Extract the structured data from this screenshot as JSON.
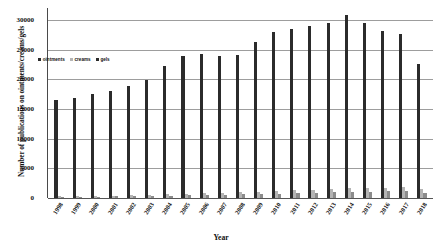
{
  "chart_data": {
    "type": "bar",
    "title": "",
    "xlabel": "Year",
    "ylabel": "Number of publications on ointments/creams/gels",
    "ylim": [
      0,
      32000
    ],
    "yticks": [
      0,
      5000,
      10000,
      15000,
      20000,
      25000,
      30000
    ],
    "ytick_labels": [
      "0",
      "5000",
      "10000",
      "15000",
      "20000",
      "25000",
      "30000"
    ],
    "grid": true,
    "legend_position": "upper-left-inside",
    "categories": [
      "1998",
      "1999",
      "2000",
      "2001",
      "2002",
      "2003",
      "2004",
      "2005",
      "2006",
      "2007",
      "2008",
      "2009",
      "2010",
      "2011",
      "2012",
      "2013",
      "2014",
      "2015",
      "2016",
      "2017",
      "2018"
    ],
    "series": [
      {
        "name": "ointments",
        "color": "#2b2b2b",
        "values": [
          16500,
          16900,
          17600,
          18000,
          18800,
          19800,
          22200,
          24000,
          24200,
          24000,
          24100,
          26200,
          27900,
          28500,
          29000,
          29500,
          30800,
          29400,
          28200,
          27600,
          22600
        ]
      },
      {
        "name": "creams",
        "color": "#b4b4b4",
        "values": [
          300,
          340,
          380,
          420,
          480,
          540,
          640,
          740,
          820,
          900,
          1000,
          1080,
          1180,
          1300,
          1400,
          1500,
          1620,
          1700,
          1760,
          1820,
          1500
        ]
      },
      {
        "name": "gels",
        "color": "#8c8c8c",
        "values": [
          180,
          200,
          230,
          260,
          300,
          340,
          400,
          460,
          520,
          580,
          640,
          700,
          760,
          820,
          880,
          940,
          1000,
          1060,
          1100,
          1140,
          900
        ]
      }
    ]
  },
  "legend": {
    "items": [
      {
        "label": "ointments",
        "color": "#2b2b2b"
      },
      {
        "label": "creams",
        "color": "#b4b4b4"
      },
      {
        "label": "gels",
        "color": "#2b2b2b"
      }
    ]
  }
}
